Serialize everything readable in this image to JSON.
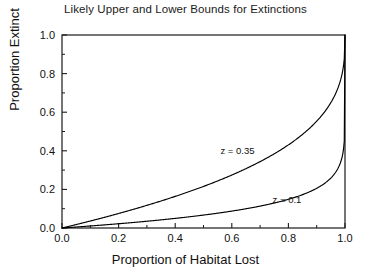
{
  "chart_data": {
    "type": "line",
    "title": "Likely Upper and Lower Bounds for Extinctions",
    "xlabel": "Proportion of Habitat Lost",
    "ylabel": "Proportion Extinct",
    "xlim": [
      0.0,
      1.0
    ],
    "ylim": [
      0.0,
      1.0
    ],
    "grid": false,
    "legend": "inline-annotations",
    "xticks": [
      "0.0",
      "0.2",
      "0.4",
      "0.6",
      "0.8",
      "1.0"
    ],
    "xtick_values": [
      0.0,
      0.2,
      0.4,
      0.6,
      0.8,
      1.0
    ],
    "yticks": [
      "0.0",
      "0.2",
      "0.4",
      "0.6",
      "0.8",
      "1.0"
    ],
    "ytick_values": [
      0.0,
      0.2,
      0.4,
      0.6,
      0.8,
      1.0
    ],
    "minor_tick_step": 0.1,
    "formula": "P = 1 - (1 - x)^z",
    "x": [
      0.0,
      0.05,
      0.1,
      0.15,
      0.2,
      0.25,
      0.3,
      0.35,
      0.4,
      0.45,
      0.5,
      0.55,
      0.6,
      0.65,
      0.7,
      0.75,
      0.8,
      0.85,
      0.9,
      0.95,
      0.97,
      0.99,
      1.0
    ],
    "series": [
      {
        "name": "z = 0.35",
        "z": 0.35,
        "label": "z = 0.35",
        "label_x": 0.62,
        "label_y": 0.385,
        "color": "#000000",
        "values": [
          0.0,
          0.018,
          0.036,
          0.055,
          0.075,
          0.096,
          0.118,
          0.141,
          0.165,
          0.191,
          0.218,
          0.247,
          0.278,
          0.312,
          0.349,
          0.39,
          0.437,
          0.492,
          0.56,
          0.657,
          0.716,
          0.798,
          1.0
        ]
      },
      {
        "name": "z = 0.1",
        "z": 0.1,
        "label": "z = 0.1",
        "label_x": 0.795,
        "label_y": 0.128,
        "color": "#000000",
        "values": [
          0.0,
          0.005,
          0.01,
          0.016,
          0.022,
          0.028,
          0.035,
          0.042,
          0.049,
          0.058,
          0.067,
          0.077,
          0.088,
          0.1,
          0.113,
          0.129,
          0.149,
          0.174,
          0.206,
          0.259,
          0.296,
          0.369,
          1.0
        ]
      }
    ]
  },
  "axes_geometry": {
    "left": 62,
    "right": 345,
    "top": 35,
    "bottom": 228
  }
}
